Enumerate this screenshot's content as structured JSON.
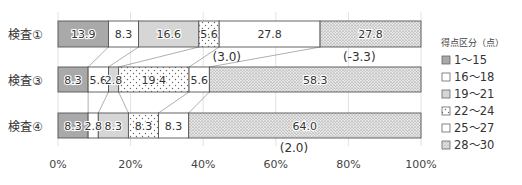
{
  "chart_data": {
    "type": "bar",
    "orientation": "horizontal",
    "stacked": "100%",
    "title": "",
    "xlabel": "",
    "ylabel": "",
    "xlim": [
      0,
      100
    ],
    "grid": true,
    "legend_position": "right",
    "x_ticks": [
      "0%",
      "20%",
      "40%",
      "60%",
      "80%",
      "100%"
    ],
    "categories": [
      "検査①",
      "検査③",
      "検査④"
    ],
    "legend_title": "得点区分（点）",
    "series": [
      {
        "name": "1～15",
        "values": [
          13.9,
          8.3,
          8.3
        ],
        "fill": "#a9a9a9",
        "pattern": "none"
      },
      {
        "name": "16～18",
        "values": [
          8.3,
          5.6,
          2.8
        ],
        "fill": "#ffffff",
        "pattern": "none"
      },
      {
        "name": "19～21",
        "values": [
          16.6,
          2.8,
          8.3
        ],
        "fill": "#d6d6d6",
        "pattern": "none"
      },
      {
        "name": "22～24",
        "values": [
          5.6,
          19.4,
          8.3
        ],
        "fill": "#ffffff",
        "pattern": "sparse-dots"
      },
      {
        "name": "25～27",
        "values": [
          27.8,
          5.6,
          8.3
        ],
        "fill": "#ffffff",
        "pattern": "none"
      },
      {
        "name": "28～30",
        "values": [
          27.8,
          58.3,
          64.0
        ],
        "fill": "#e4e4e4",
        "pattern": "dense-dots"
      }
    ],
    "value_labels": [
      [
        "13.9",
        "8.3",
        "16.6",
        "5.6",
        "27.8",
        "27.8"
      ],
      [
        "8.3",
        "5.6",
        "2.8",
        "19.4",
        "5.6",
        "58.3"
      ],
      [
        "8.3",
        "2.8",
        "8.3",
        "8.3",
        "8.3",
        "64.0"
      ]
    ],
    "annotations": [
      {
        "text": "(3.0)",
        "row": 0,
        "x_pct": 46.5
      },
      {
        "text": "(-3.3)",
        "row": 0,
        "x_pct": 83.0
      },
      {
        "text": "(2.0)",
        "row": 2,
        "x_pct": 65.0
      }
    ]
  },
  "legend": {
    "title": "得点区分（点）",
    "items": [
      "1～15",
      "16～18",
      "19～21",
      "22～24",
      "25～27",
      "28～30"
    ]
  }
}
